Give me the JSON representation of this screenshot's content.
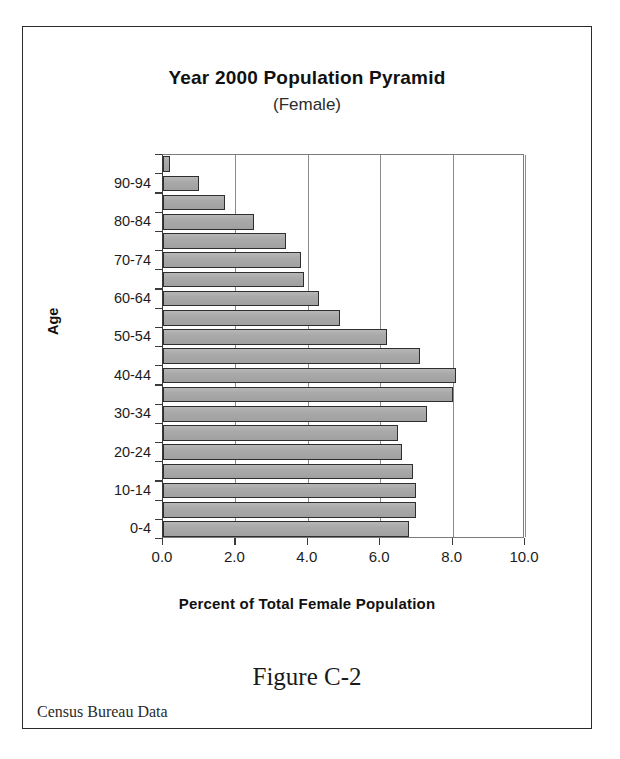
{
  "figure": {
    "caption": "Figure C-2",
    "source_note": "Census Bureau Data"
  },
  "chart_data": {
    "type": "bar",
    "orientation": "horizontal",
    "title": "Year 2000 Population Pyramid",
    "subtitle": "(Female)",
    "xlabel": "Percent of Total Female Population",
    "ylabel": "Age",
    "xlim": [
      0.0,
      10.0
    ],
    "xticks": [
      0.0,
      2.0,
      4.0,
      6.0,
      8.0,
      10.0
    ],
    "xticklabels": [
      "0.0",
      "2.0",
      "4.0",
      "6.0",
      "8.0",
      "10.0"
    ],
    "grid": "vertical",
    "legend": "none",
    "bar_color": "#a9a9a9",
    "bar_edge_color": "#2e2e2e",
    "categories": [
      "95-99",
      "90-94",
      "85-89",
      "80-84",
      "75-79",
      "70-74",
      "65-69",
      "60-64",
      "55-59",
      "50-54",
      "45-49",
      "40-44",
      "35-39",
      "30-34",
      "25-29",
      "20-24",
      "15-19",
      "10-14",
      "5-9",
      "0-4"
    ],
    "values": [
      0.2,
      1.0,
      1.7,
      2.5,
      3.4,
      3.8,
      3.9,
      4.3,
      4.9,
      6.2,
      7.1,
      8.1,
      8.0,
      7.3,
      6.5,
      6.6,
      6.9,
      7.0,
      7.0,
      6.8
    ],
    "ytick_labels_shown": [
      "90-94",
      "80-84",
      "70-74",
      "60-64",
      "50-54",
      "40-44",
      "30-34",
      "20-24",
      "10-14",
      "0-4"
    ]
  }
}
